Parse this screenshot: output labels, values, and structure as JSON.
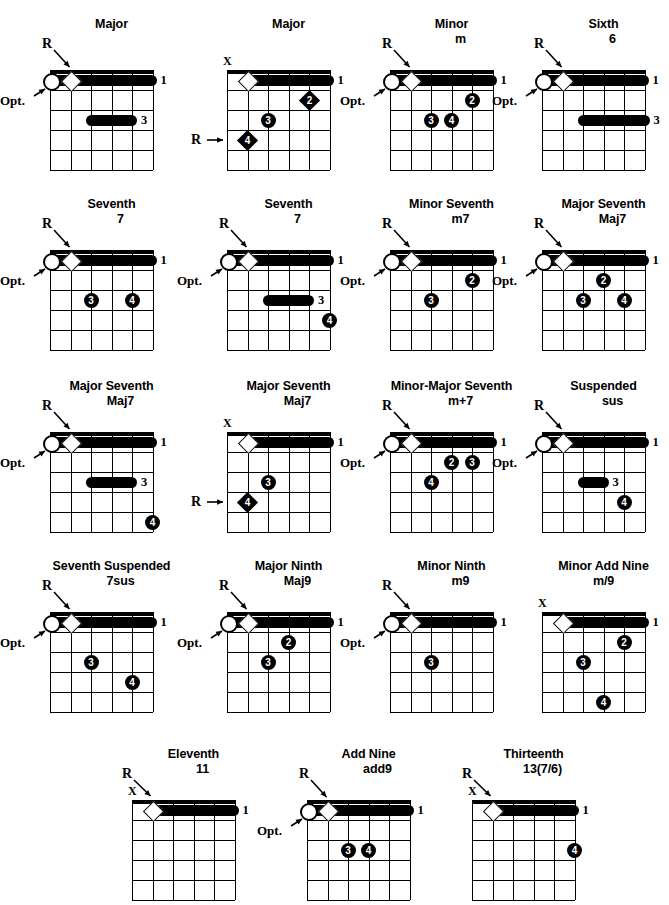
{
  "page": {
    "kind": "guitar-chord-form-chart",
    "width": 669,
    "height": 899,
    "ink_color": "#000000",
    "paper_color": "#ffffff",
    "labels": {
      "root": "R",
      "optional": "Opt.",
      "muted": "X"
    },
    "grid": {
      "strings": 6,
      "frets": 5,
      "columns_drawn": 5,
      "rows_drawn": 5
    }
  },
  "chords": [
    {
      "id": "major-1",
      "name": "Major",
      "symbol": "",
      "x": 28,
      "y": 18,
      "open_circle": true,
      "root_label": "R",
      "opt_label": "Opt.",
      "muted_label": "",
      "barre_fret": 1,
      "barre_label": "1",
      "markers": [
        {
          "type": "bar",
          "fret": 3,
          "from_string": 3,
          "to_string": 5,
          "label": "3"
        }
      ]
    },
    {
      "id": "major-2",
      "name": "Major",
      "symbol": "",
      "x": 205,
      "y": 18,
      "open_circle": false,
      "root_label": "R",
      "opt_label": "",
      "muted_label": "X",
      "barre_fret": 1,
      "barre_label": "1",
      "markers": [
        {
          "type": "dot-diamond",
          "fret": 2,
          "string": 5,
          "label": "2"
        },
        {
          "type": "dot",
          "fret": 3,
          "string": 3,
          "label": "3"
        },
        {
          "type": "dot-diamond",
          "fret": 4,
          "string": 2,
          "label": "4"
        }
      ]
    },
    {
      "id": "minor",
      "name": "Minor",
      "symbol": "m",
      "x": 368,
      "y": 18,
      "open_circle": true,
      "root_label": "R",
      "opt_label": "Opt.",
      "muted_label": "",
      "barre_fret": 1,
      "barre_label": "1",
      "markers": [
        {
          "type": "dot",
          "fret": 2,
          "string": 5,
          "label": "2"
        },
        {
          "type": "dot",
          "fret": 3,
          "string": 3,
          "label": "3"
        },
        {
          "type": "dot",
          "fret": 3,
          "string": 4,
          "label": "4"
        }
      ]
    },
    {
      "id": "sixth",
      "name": "Sixth",
      "symbol": "6",
      "x": 520,
      "y": 18,
      "open_circle": true,
      "root_label": "R",
      "opt_label": "Opt.",
      "muted_label": "",
      "barre_fret": 1,
      "barre_label": "1",
      "markers": [
        {
          "type": "bar",
          "fret": 3,
          "from_string": 3,
          "to_string": 6,
          "label": "3"
        }
      ]
    },
    {
      "id": "seventh-1",
      "name": "Seventh",
      "symbol": "7",
      "x": 28,
      "y": 198,
      "open_circle": true,
      "root_label": "R",
      "opt_label": "Opt.",
      "muted_label": "",
      "barre_fret": 1,
      "barre_label": "1",
      "markers": [
        {
          "type": "dot",
          "fret": 3,
          "string": 3,
          "label": "3"
        },
        {
          "type": "dot",
          "fret": 3,
          "string": 5,
          "label": "4"
        }
      ]
    },
    {
      "id": "seventh-2",
      "name": "Seventh",
      "symbol": "7",
      "x": 205,
      "y": 198,
      "open_circle": true,
      "root_label": "R",
      "opt_label": "Opt.",
      "muted_label": "",
      "barre_fret": 1,
      "barre_label": "1",
      "markers": [
        {
          "type": "bar",
          "fret": 3,
          "from_string": 3,
          "to_string": 5,
          "label": "3"
        },
        {
          "type": "dot",
          "fret": 4,
          "string": 6,
          "label": "4"
        }
      ]
    },
    {
      "id": "minor-seventh",
      "name": "Minor Seventh",
      "symbol": "m7",
      "x": 368,
      "y": 198,
      "open_circle": true,
      "root_label": "R",
      "opt_label": "Opt.",
      "muted_label": "",
      "barre_fret": 1,
      "barre_label": "1",
      "markers": [
        {
          "type": "dot",
          "fret": 2,
          "string": 5,
          "label": "2"
        },
        {
          "type": "dot",
          "fret": 3,
          "string": 3,
          "label": "3"
        }
      ]
    },
    {
      "id": "major-seventh-1",
      "name": "Major Seventh",
      "symbol": "Maj7",
      "x": 520,
      "y": 198,
      "open_circle": true,
      "root_label": "R",
      "opt_label": "Opt.",
      "muted_label": "",
      "barre_fret": 1,
      "barre_label": "1",
      "markers": [
        {
          "type": "dot",
          "fret": 2,
          "string": 4,
          "label": "2"
        },
        {
          "type": "dot",
          "fret": 3,
          "string": 3,
          "label": "3"
        },
        {
          "type": "dot",
          "fret": 3,
          "string": 5,
          "label": "4"
        }
      ]
    },
    {
      "id": "major-seventh-2",
      "name": "Major Seventh",
      "symbol": "Maj7",
      "x": 28,
      "y": 380,
      "open_circle": true,
      "root_label": "R",
      "opt_label": "Opt.",
      "muted_label": "",
      "barre_fret": 1,
      "barre_label": "1",
      "markers": [
        {
          "type": "bar",
          "fret": 3,
          "from_string": 3,
          "to_string": 5,
          "label": "3"
        },
        {
          "type": "dot",
          "fret": 5,
          "string": 6,
          "label": "4"
        }
      ]
    },
    {
      "id": "major-seventh-3",
      "name": "Major Seventh",
      "symbol": "Maj7",
      "x": 205,
      "y": 380,
      "open_circle": false,
      "root_label": "R",
      "opt_label": "",
      "muted_label": "X",
      "barre_fret": 1,
      "barre_label": "1",
      "markers": [
        {
          "type": "dot",
          "fret": 3,
          "string": 3,
          "label": "3"
        },
        {
          "type": "dot-diamond",
          "fret": 4,
          "string": 2,
          "label": "4"
        }
      ]
    },
    {
      "id": "minor-major-seventh",
      "name": "Minor-Major Seventh",
      "symbol": "m+7",
      "x": 368,
      "y": 380,
      "open_circle": true,
      "root_label": "R",
      "opt_label": "Opt.",
      "muted_label": "",
      "barre_fret": 1,
      "barre_label": "1",
      "markers": [
        {
          "type": "dot",
          "fret": 2,
          "string": 4,
          "label": "2"
        },
        {
          "type": "dot",
          "fret": 2,
          "string": 5,
          "label": "3"
        },
        {
          "type": "dot",
          "fret": 3,
          "string": 3,
          "label": "4"
        }
      ]
    },
    {
      "id": "suspended",
      "name": "Suspended",
      "symbol": "sus",
      "x": 520,
      "y": 380,
      "open_circle": true,
      "root_label": "R",
      "opt_label": "Opt.",
      "muted_label": "",
      "barre_fret": 1,
      "barre_label": "1",
      "markers": [
        {
          "type": "bar",
          "fret": 3,
          "from_string": 3,
          "to_string": 4,
          "label": "3"
        },
        {
          "type": "dot",
          "fret": 4,
          "string": 5,
          "label": "4"
        }
      ]
    },
    {
      "id": "seventh-suspended",
      "name": "Seventh Suspended",
      "symbol": "7sus",
      "x": 28,
      "y": 560,
      "open_circle": true,
      "root_label": "R",
      "opt_label": "Opt.",
      "muted_label": "",
      "barre_fret": 1,
      "barre_label": "1",
      "markers": [
        {
          "type": "dot",
          "fret": 3,
          "string": 3,
          "label": "3"
        },
        {
          "type": "dot",
          "fret": 4,
          "string": 5,
          "label": "4"
        }
      ]
    },
    {
      "id": "major-ninth",
      "name": "Major Ninth",
      "symbol": "Maj9",
      "x": 205,
      "y": 560,
      "open_circle": true,
      "root_label": "R",
      "opt_label": "Opt.",
      "muted_label": "",
      "barre_fret": 1,
      "barre_label": "1",
      "markers": [
        {
          "type": "dot",
          "fret": 2,
          "string": 4,
          "label": "2"
        },
        {
          "type": "dot",
          "fret": 3,
          "string": 3,
          "label": "3"
        }
      ]
    },
    {
      "id": "minor-ninth",
      "name": "Minor Ninth",
      "symbol": "m9",
      "x": 368,
      "y": 560,
      "open_circle": true,
      "root_label": "R",
      "opt_label": "Opt.",
      "muted_label": "",
      "barre_fret": 1,
      "barre_label": "1",
      "markers": [
        {
          "type": "dot",
          "fret": 3,
          "string": 3,
          "label": "3"
        }
      ]
    },
    {
      "id": "minor-add-nine",
      "name": "Minor Add Nine",
      "symbol": "m/9",
      "x": 520,
      "y": 560,
      "open_circle": false,
      "root_label": "",
      "opt_label": "",
      "muted_label": "X",
      "barre_fret": 1,
      "barre_label": "1",
      "markers": [
        {
          "type": "dot",
          "fret": 2,
          "string": 5,
          "label": "2"
        },
        {
          "type": "dot",
          "fret": 3,
          "string": 3,
          "label": "3"
        },
        {
          "type": "dot",
          "fret": 5,
          "string": 4,
          "label": "4"
        }
      ]
    },
    {
      "id": "eleventh",
      "name": "Eleventh",
      "symbol": "11",
      "x": 110,
      "y": 748,
      "open_circle": false,
      "root_label": "R",
      "opt_label": "",
      "muted_label": "X",
      "barre_fret": 1,
      "barre_label": "1",
      "markers": []
    },
    {
      "id": "add-nine",
      "name": "Add Nine",
      "symbol": "add9",
      "x": 285,
      "y": 748,
      "open_circle": true,
      "root_label": "R",
      "opt_label": "Opt.",
      "muted_label": "",
      "barre_fret": 1,
      "barre_label": "1",
      "markers": [
        {
          "type": "dot",
          "fret": 3,
          "string": 3,
          "label": "3"
        },
        {
          "type": "dot",
          "fret": 3,
          "string": 4,
          "label": "4"
        }
      ]
    },
    {
      "id": "thirteenth",
      "name": "Thirteenth",
      "symbol": "13(7/6)",
      "x": 450,
      "y": 748,
      "open_circle": false,
      "root_label": "R",
      "opt_label": "",
      "muted_label": "X",
      "barre_fret": 1,
      "barre_label": "1",
      "markers": [
        {
          "type": "dot",
          "fret": 3,
          "string": 6,
          "label": "4"
        }
      ]
    }
  ]
}
